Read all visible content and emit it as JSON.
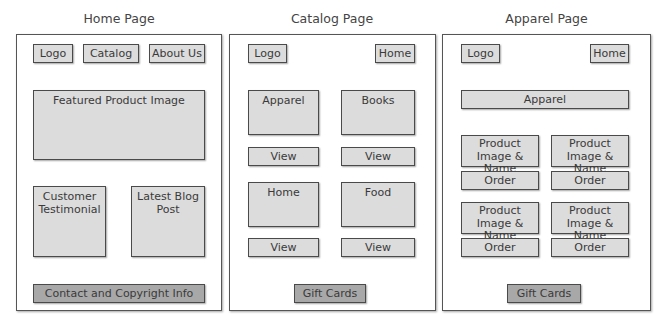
{
  "pages": {
    "home": {
      "title": "Home Page",
      "nav": {
        "logo": "Logo",
        "catalog": "Catalog",
        "about": "About Us"
      },
      "featured": "Featured Product Image",
      "testimonial": "Customer Testimonial",
      "blog": "Latest Blog Post",
      "footer": "Contact and Copyright Info"
    },
    "catalog": {
      "title": "Catalog Page",
      "nav": {
        "logo": "Logo",
        "home": "Home"
      },
      "categories": [
        {
          "label": "Apparel",
          "action": "View"
        },
        {
          "label": "Books",
          "action": "View"
        },
        {
          "label": "Home",
          "action": "View"
        },
        {
          "label": "Food",
          "action": "View"
        }
      ],
      "footer": "Gift Cards"
    },
    "apparel": {
      "title": "Apparel Page",
      "nav": {
        "logo": "Logo",
        "home": "Home"
      },
      "header": "Apparel",
      "products": [
        {
          "label": "Product Image & Name",
          "action": "Order"
        },
        {
          "label": "Product Image & Name",
          "action": "Order"
        },
        {
          "label": "Product Image & Name",
          "action": "Order"
        },
        {
          "label": "Product Image & Name",
          "action": "Order"
        }
      ],
      "footer": "Gift Cards"
    }
  },
  "colors": {
    "box_fill": "#dcdcdc",
    "box_fill_dark": "#a8a8a8",
    "border": "#4a4a4a",
    "background": "#ffffff"
  }
}
